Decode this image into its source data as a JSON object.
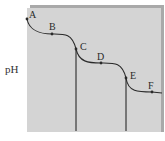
{
  "diagram": {
    "type": "titration-curve",
    "y_axis_label": "pH",
    "colors": {
      "panel": "#d4d4d4",
      "shadow": "#a9a9a9",
      "curve": "#2a2a2a"
    },
    "points": [
      {
        "label": "A",
        "x": 27,
        "y": 19,
        "lx": 29,
        "ly": 18
      },
      {
        "label": "B",
        "x": 52,
        "y": 34,
        "lx": 49,
        "ly": 30
      },
      {
        "label": "C",
        "x": 76,
        "y": 49,
        "lx": 80,
        "ly": 50
      },
      {
        "label": "D",
        "x": 101,
        "y": 63,
        "lx": 97,
        "ly": 60
      },
      {
        "label": "E",
        "x": 126,
        "y": 78,
        "lx": 130,
        "ly": 79
      },
      {
        "label": "F",
        "x": 152,
        "y": 92,
        "lx": 148,
        "ly": 89
      }
    ],
    "equivalence_lines": [
      {
        "x": 76,
        "y_top": 49,
        "y_bottom": 131
      },
      {
        "x": 126,
        "y_top": 78,
        "y_bottom": 131
      }
    ]
  }
}
